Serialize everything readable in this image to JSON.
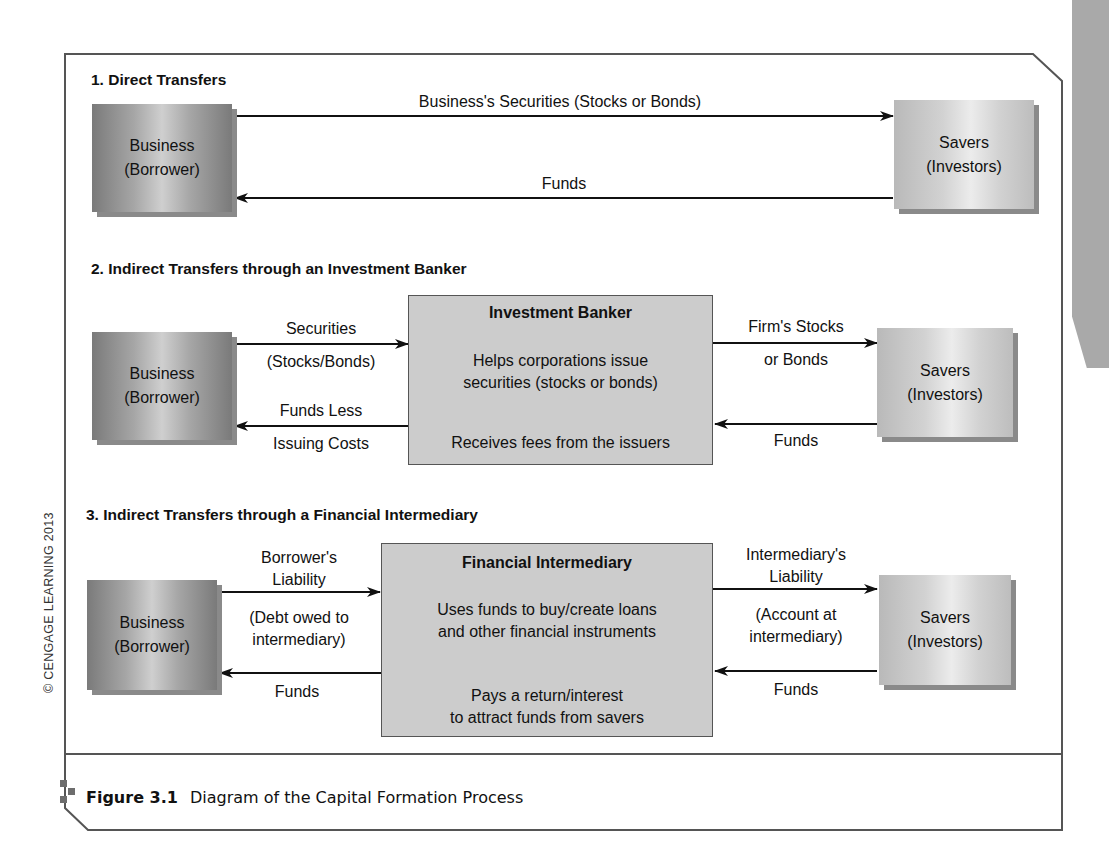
{
  "copyright": "© CENGAGE LEARNING 2013",
  "caption": {
    "figure_number": "Figure 3.1",
    "title": "Diagram of the Capital Formation Process",
    "icon": "figure-marker-icon"
  },
  "sections": [
    {
      "title": "1. Direct Transfers",
      "business": {
        "line1": "Business",
        "line2": "(Borrower)"
      },
      "savers": {
        "line1": "Savers",
        "line2": "(Investors)"
      },
      "top_flow_label": "Business's Securities (Stocks or Bonds)",
      "bottom_flow_label": "Funds"
    },
    {
      "title": "2. Indirect Transfers through an Investment Banker",
      "business": {
        "line1": "Business",
        "line2": "(Borrower)"
      },
      "savers": {
        "line1": "Savers",
        "line2": "(Investors)"
      },
      "intermediary": {
        "title": "Investment Banker",
        "top_text": [
          "Helps corporations issue",
          "securities (stocks or bonds)"
        ],
        "bottom_text": [
          "Receives fees from the issuers"
        ]
      },
      "left_top_label": [
        "Securities",
        "(Stocks/Bonds)"
      ],
      "left_bottom_label": [
        "Funds Less",
        "Issuing Costs"
      ],
      "right_top_label": [
        "Firm's Stocks",
        "or Bonds"
      ],
      "right_bottom_label": [
        "Funds"
      ]
    },
    {
      "title": "3. Indirect Transfers through a Financial Intermediary",
      "business": {
        "line1": "Business",
        "line2": "(Borrower)"
      },
      "savers": {
        "line1": "Savers",
        "line2": "(Investors)"
      },
      "intermediary": {
        "title": "Financial Intermediary",
        "top_text": [
          "Uses funds to buy/create loans",
          "and other financial instruments"
        ],
        "bottom_text": [
          "Pays a return/interest",
          "to attract funds from savers"
        ]
      },
      "left_top_label": [
        "Borrower's",
        "Liability"
      ],
      "left_top_sub_label": [
        "(Debt owed to",
        "intermediary)"
      ],
      "left_bottom_label": [
        "Funds"
      ],
      "right_top_label": [
        "Intermediary's",
        "Liability"
      ],
      "right_top_sub_label": [
        "(Account at",
        "intermediary)"
      ],
      "right_bottom_label": [
        "Funds"
      ]
    }
  ]
}
